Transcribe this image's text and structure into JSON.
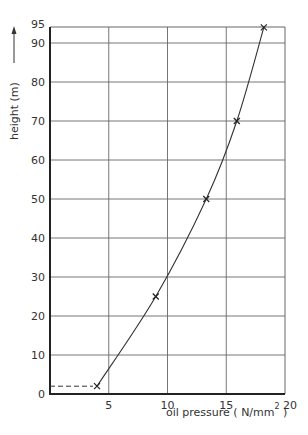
{
  "chart_data": {
    "type": "line",
    "title": "",
    "xlabel": "oil pressure ( N/mm² )",
    "xlabel_main": "oil pressure ( N/mm",
    "xlabel_sup": "2",
    "xlabel_close": " )",
    "ylabel": "height (m)",
    "xlim": [
      0,
      20
    ],
    "ylim": [
      0,
      95
    ],
    "x_ticks": [
      "5",
      "10",
      "15",
      "20"
    ],
    "x_tick_values": [
      5,
      10,
      15,
      20
    ],
    "y_ticks": [
      "0",
      "10",
      "20",
      "30",
      "40",
      "50",
      "60",
      "70",
      "80",
      "90",
      "95"
    ],
    "y_tick_values": [
      0,
      10,
      20,
      30,
      40,
      50,
      60,
      70,
      80,
      90,
      95
    ],
    "grid": true,
    "legend": null,
    "series": [
      {
        "name": "measured",
        "marker": "x",
        "x": [
          4.0,
          9.0,
          13.3,
          15.9,
          18.2
        ],
        "y": [
          2,
          25,
          50,
          70,
          94
        ]
      }
    ],
    "annotations": [
      {
        "type": "dashed-line",
        "from": [
          0,
          2
        ],
        "to": [
          4.0,
          2
        ]
      },
      {
        "type": "arrow",
        "direction": "up",
        "beside": "ylabel"
      }
    ],
    "colors": {
      "line": "#333333",
      "grid": "#666666",
      "axis": "#222222"
    }
  }
}
